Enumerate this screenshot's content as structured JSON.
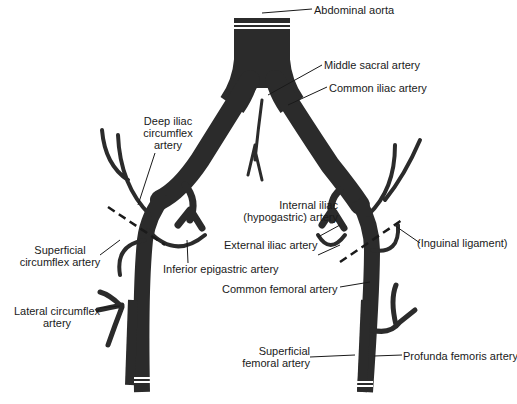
{
  "diagram": {
    "colors": {
      "vessel": "#2b2b2b",
      "line": "#1a1a1a",
      "background": "#ffffff"
    },
    "labels": {
      "abdominal_aorta": "Abdominal aorta",
      "middle_sacral": "Middle sacral artery",
      "common_iliac": "Common iliac artery",
      "deep_iliac_1": "Deep iliac",
      "deep_iliac_2": "circumflex",
      "deep_iliac_3": "artery",
      "internal_iliac_1": "Internal iliac",
      "internal_iliac_2": "(hypogastric) artery",
      "external_iliac": "External iliac artery",
      "inguinal_ligament": "(Inguinal ligament)",
      "superficial_circumflex_1": "Superficial",
      "superficial_circumflex_2": "circumflex artery",
      "inferior_epigastric": "Inferior epigastric artery",
      "common_femoral": "Common femoral artery",
      "lateral_circumflex_1": "Lateral circumflex",
      "lateral_circumflex_2": "artery",
      "superficial_femoral_1": "Superficial",
      "superficial_femoral_2": "femoral artery",
      "profunda_femoris": "Profunda femoris artery"
    }
  }
}
